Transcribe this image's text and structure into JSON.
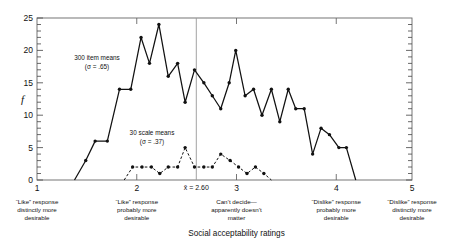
{
  "chart_data": {
    "type": "line",
    "title": "",
    "xlabel": "Social acceptability ratings",
    "ylabel": "f",
    "xlim": [
      1,
      5
    ],
    "ylim": [
      0,
      25
    ],
    "grid": false,
    "legend": "inline-annotations",
    "x_ticks": [
      1,
      2,
      3,
      4,
      5
    ],
    "x_tick_labels": [
      "1",
      "2",
      "3",
      "4",
      "5"
    ],
    "y_ticks": [
      0,
      5,
      10,
      15,
      20,
      25
    ],
    "y_tick_labels": [
      "0",
      "5",
      "10",
      "15",
      "20",
      "25"
    ],
    "y_minor_tick_step": 1,
    "reference_line": {
      "x": 2.6,
      "label": "x̄ = 2.60"
    },
    "series": [
      {
        "name": "300 item means",
        "sigma": 0.65,
        "annotation": "300 item means",
        "annotation_sigma": "(σ = .65)",
        "style": "solid",
        "points": [
          [
            1.4,
            0
          ],
          [
            1.52,
            3
          ],
          [
            1.62,
            6
          ],
          [
            1.75,
            6
          ],
          [
            1.88,
            14
          ],
          [
            2.0,
            14
          ],
          [
            2.11,
            22
          ],
          [
            2.2,
            18
          ],
          [
            2.3,
            24
          ],
          [
            2.4,
            16
          ],
          [
            2.5,
            18
          ],
          [
            2.58,
            12
          ],
          [
            2.68,
            17
          ],
          [
            2.78,
            15
          ],
          [
            2.87,
            13
          ],
          [
            2.96,
            11
          ],
          [
            3.05,
            15
          ],
          [
            3.12,
            20
          ],
          [
            3.22,
            13
          ],
          [
            3.31,
            14
          ],
          [
            3.4,
            10
          ],
          [
            3.5,
            14
          ],
          [
            3.59,
            9
          ],
          [
            3.68,
            14
          ],
          [
            3.76,
            11
          ],
          [
            3.85,
            11
          ],
          [
            3.94,
            4
          ],
          [
            4.03,
            8
          ],
          [
            4.12,
            7
          ],
          [
            4.22,
            5
          ],
          [
            4.3,
            5
          ],
          [
            4.4,
            0
          ]
        ]
      },
      {
        "name": "30 scale means",
        "sigma": 0.37,
        "annotation": "30 scale means",
        "annotation_sigma": "(σ = .37)",
        "style": "dashed",
        "points": [
          [
            1.93,
            0
          ],
          [
            2.02,
            2
          ],
          [
            2.12,
            2
          ],
          [
            2.22,
            2
          ],
          [
            2.31,
            1
          ],
          [
            2.4,
            2
          ],
          [
            2.5,
            2
          ],
          [
            2.58,
            5
          ],
          [
            2.68,
            2
          ],
          [
            2.78,
            2
          ],
          [
            2.87,
            2
          ],
          [
            2.96,
            4
          ],
          [
            3.06,
            3
          ],
          [
            3.15,
            2
          ],
          [
            3.24,
            1
          ],
          [
            3.33,
            2
          ],
          [
            3.42,
            1
          ],
          [
            3.5,
            0
          ]
        ]
      }
    ],
    "x_category_labels": [
      {
        "x": 1,
        "lines": [
          "“Like” response",
          "distinctly more",
          "desirable"
        ]
      },
      {
        "x": 2,
        "lines": [
          "“Like” response",
          "probably more",
          "desirable"
        ]
      },
      {
        "x": 3,
        "lines": [
          "Can’t decide—",
          "apparently doesn’t",
          "matter"
        ]
      },
      {
        "x": 4,
        "lines": [
          "“Dislike” response",
          "probably more",
          "desirable"
        ]
      },
      {
        "x": 5,
        "lines": [
          "“Dislike” response",
          "distinctly more",
          "desirable"
        ]
      }
    ]
  },
  "labels": {
    "y_axis_symbol": "f",
    "x_axis_title": "Social acceptability ratings",
    "series1_line1": "300 item means",
    "series1_line2": "(σ = .65)",
    "series2_line1": "30 scale means",
    "series2_line2": "(σ = .37)",
    "mean_marker": "x̄ = 2.60",
    "ytick_0": "0",
    "ytick_5": "5",
    "ytick_10": "10",
    "ytick_15": "15",
    "ytick_20": "20",
    "ytick_25": "25",
    "xtick_1": "1",
    "xtick_2": "2",
    "xtick_3": "3",
    "xtick_4": "4",
    "xtick_5": "5",
    "cat1_l1": "“Like” response",
    "cat1_l2": "distinctly more",
    "cat1_l3": "desirable",
    "cat2_l1": "“Like” response",
    "cat2_l2": "probably more",
    "cat2_l3": "desirable",
    "cat3_l1": "Can’t decide—",
    "cat3_l2": "apparently doesn’t",
    "cat3_l3": "matter",
    "cat4_l1": "“Dislike” response",
    "cat4_l2": "probably more",
    "cat4_l3": "desirable",
    "cat5_l1": "“Dislike” response",
    "cat5_l2": "distinctly more",
    "cat5_l3": "desirable"
  },
  "colors": {
    "ink": "#111111",
    "axis": "#555555",
    "background": "#ffffff"
  }
}
